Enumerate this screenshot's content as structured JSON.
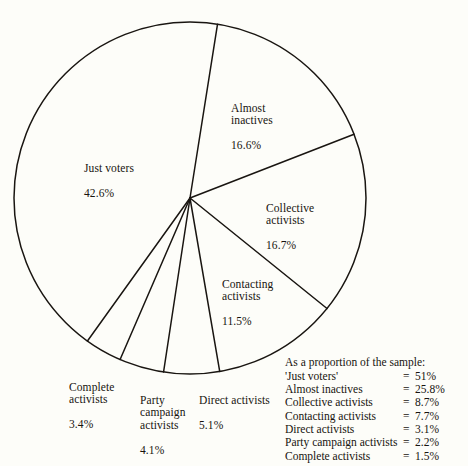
{
  "chart_data": {
    "type": "pie",
    "title": "",
    "subtitle": "",
    "xlabel": "",
    "ylabel": "",
    "legend_position": "bottom-right",
    "grid": false,
    "units": "%",
    "start_angle_deg": 9,
    "direction": "clockwise",
    "categories": [
      "Almost inactives",
      "Collective activists",
      "Contacting activists",
      "Direct activists",
      "Party campaign activists",
      "Complete activists",
      "Just voters"
    ],
    "values": [
      16.6,
      16.7,
      11.5,
      5.1,
      4.1,
      3.4,
      42.6
    ],
    "slices": [
      {
        "name": "Almost inactives",
        "value": 16.6,
        "label": "Almost\ninactives",
        "value_label": "16.6%"
      },
      {
        "name": "Collective activists",
        "value": 16.7,
        "label": "Collective\nactivists",
        "value_label": "16.7%"
      },
      {
        "name": "Contacting activists",
        "value": 11.5,
        "label": "Contacting\nactivists",
        "value_label": "11.5%"
      },
      {
        "name": "Direct activists",
        "value": 5.1,
        "label": "Direct activists",
        "value_label": "5.1%"
      },
      {
        "name": "Party campaign activists",
        "value": 4.1,
        "label": "Party\ncampaign\nactivists",
        "value_label": "4.1%"
      },
      {
        "name": "Complete activists",
        "value": 3.4,
        "label": "Complete\nactivists",
        "value_label": "3.4%"
      },
      {
        "name": "Just voters",
        "value": 42.6,
        "label": "Just voters",
        "value_label": "42.6%"
      }
    ],
    "annotations": {
      "legend_title": "As a proportion of the sample:",
      "legend_rows": [
        {
          "label": "'Just voters'",
          "eq": "=",
          "value": "51%"
        },
        {
          "label": "Almost inactives",
          "eq": "=",
          "value": "25.8%"
        },
        {
          "label": "Collective activists",
          "eq": "=",
          "value": "8.7%"
        },
        {
          "label": "Contacting activists",
          "eq": "=",
          "value": "7.7%"
        },
        {
          "label": "Direct activists",
          "eq": "=",
          "value": "3.1%"
        },
        {
          "label": "Party campaign activists",
          "eq": "=",
          "value": "2.2%"
        },
        {
          "label": "Complete activists",
          "eq": "=",
          "value": "1.5%"
        }
      ]
    },
    "colors": {
      "background": "#fdfdf9",
      "stroke": "#191511",
      "text": "#17140f"
    }
  },
  "labels": {
    "almost_inactives": {
      "name": "Almost\ninactives",
      "pct": "16.6%"
    },
    "just_voters": {
      "name": "Just voters",
      "pct": "42.6%"
    },
    "collective": {
      "name": "Collective\nactivists",
      "pct": "16.7%"
    },
    "contacting": {
      "name": "Contacting\nactivists",
      "pct": "11.5%"
    },
    "complete": {
      "name": "Complete\nactivists",
      "pct": "3.4%"
    },
    "party_campaign": {
      "name": "Party\ncampaign\nactivists",
      "pct": "4.1%"
    },
    "direct": {
      "name": "Direct activists",
      "pct": "5.1%"
    }
  },
  "legend": {
    "title": "As a proportion of the sample:",
    "rows": [
      {
        "label": "'Just voters'",
        "eq": "=",
        "value": "51%"
      },
      {
        "label": "Almost inactives",
        "eq": "=",
        "value": "25.8%"
      },
      {
        "label": "Collective activists",
        "eq": "=",
        "value": "8.7%"
      },
      {
        "label": "Contacting activists",
        "eq": "=",
        "value": "7.7%"
      },
      {
        "label": "Direct activists",
        "eq": "=",
        "value": "3.1%"
      },
      {
        "label": "Party campaign activists",
        "eq": "=",
        "value": "2.2%"
      },
      {
        "label": "Complete activists",
        "eq": "=",
        "value": "1.5%"
      }
    ]
  }
}
